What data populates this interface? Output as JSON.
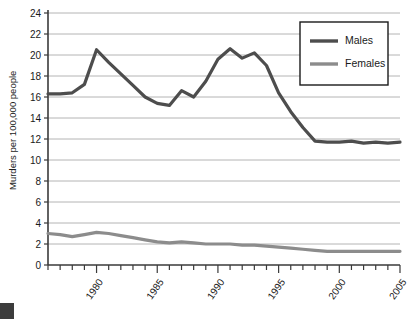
{
  "chart_data": {
    "type": "line",
    "title": "",
    "xlabel": "",
    "ylabel": "Murders per 100,000 people",
    "xlim": [
      1976,
      2005
    ],
    "ylim": [
      0,
      24
    ],
    "yticks": [
      0,
      2,
      4,
      6,
      8,
      10,
      12,
      14,
      16,
      18,
      20,
      22,
      24
    ],
    "ytick_labels": [
      "0",
      "2",
      "4",
      "6",
      "8",
      "10",
      "12",
      "14",
      "16",
      "18",
      "20",
      "22",
      "24"
    ],
    "xticks": [
      1980,
      1985,
      1990,
      1995,
      2000,
      2005
    ],
    "xtick_labels": [
      "1980",
      "1985",
      "1990",
      "1995",
      "2000",
      "2005"
    ],
    "xtick_minor_every": 1,
    "grid": "horizontal",
    "legend_position": "top-right",
    "x": [
      1976,
      1977,
      1978,
      1979,
      1980,
      1981,
      1982,
      1983,
      1984,
      1985,
      1986,
      1987,
      1988,
      1989,
      1990,
      1991,
      1992,
      1993,
      1994,
      1995,
      1996,
      1997,
      1998,
      1999,
      2000,
      2001,
      2002,
      2003,
      2004,
      2005
    ],
    "series": [
      {
        "name": "Males",
        "color": "#4d4d4d",
        "stroke_width": 3.2,
        "values": [
          16.3,
          16.3,
          16.4,
          17.2,
          20.5,
          19.3,
          18.2,
          17.1,
          16.0,
          15.4,
          15.2,
          16.6,
          16.0,
          17.5,
          19.6,
          20.6,
          19.7,
          20.2,
          19.0,
          16.4,
          14.6,
          13.1,
          11.8,
          11.7,
          11.7,
          11.8,
          11.6,
          11.7,
          11.6,
          11.7
        ]
      },
      {
        "name": "Females",
        "color": "#8c8c8c",
        "stroke_width": 3.2,
        "values": [
          3.0,
          2.9,
          2.7,
          2.9,
          3.1,
          3.0,
          2.8,
          2.6,
          2.4,
          2.2,
          2.1,
          2.2,
          2.1,
          2.0,
          2.0,
          2.0,
          1.9,
          1.9,
          1.8,
          1.7,
          1.6,
          1.5,
          1.4,
          1.3,
          1.3,
          1.3,
          1.3,
          1.3,
          1.3,
          1.3
        ]
      }
    ],
    "legend": [
      {
        "label": "Males",
        "color": "#4d4d4d"
      },
      {
        "label": "Females",
        "color": "#8c8c8c"
      }
    ]
  },
  "geometry": {
    "plot_left": 48,
    "plot_right": 400,
    "plot_top": 13,
    "plot_bottom": 265,
    "legend_x": 300,
    "legend_y": 22,
    "legend_w": 88,
    "legend_h": 63
  },
  "decoration": {
    "corner_mark": "page-corner-mark"
  }
}
